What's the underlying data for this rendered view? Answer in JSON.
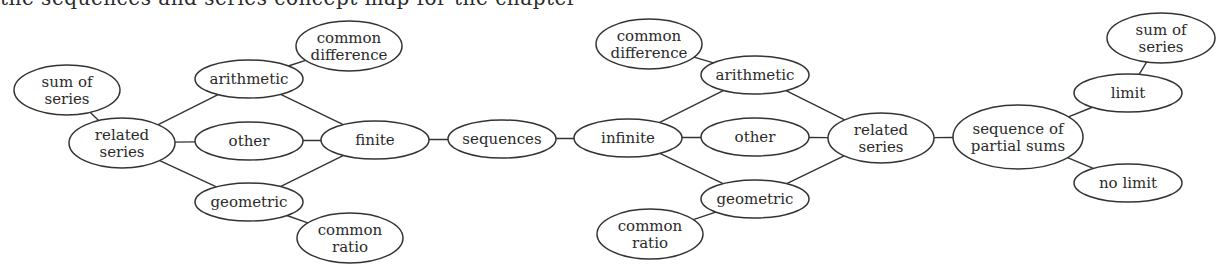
{
  "clipped_header_text": "the sequences and series concept map for the chapter",
  "diagram": {
    "type": "concept-map",
    "nodes": [
      {
        "id": "sum_series_l",
        "lines": [
          "sum of",
          "series"
        ],
        "cx": 67,
        "cy": 90,
        "rx": 53,
        "ry": 25
      },
      {
        "id": "related_l",
        "lines": [
          "related",
          "series"
        ],
        "cx": 122,
        "cy": 143,
        "rx": 53,
        "ry": 25
      },
      {
        "id": "arith_l",
        "lines": [
          "arithmetic"
        ],
        "cx": 249,
        "cy": 79,
        "rx": 54,
        "ry": 19
      },
      {
        "id": "cdiff_l",
        "lines": [
          "common",
          "difference"
        ],
        "cx": 349,
        "cy": 46,
        "rx": 53,
        "ry": 25
      },
      {
        "id": "other_l",
        "lines": [
          "other"
        ],
        "cx": 249,
        "cy": 141,
        "rx": 54,
        "ry": 19
      },
      {
        "id": "finite",
        "lines": [
          "finite"
        ],
        "cx": 375,
        "cy": 140,
        "rx": 54,
        "ry": 19
      },
      {
        "id": "geom_l",
        "lines": [
          "geometric"
        ],
        "cx": 249,
        "cy": 202,
        "rx": 54,
        "ry": 19
      },
      {
        "id": "cratio_l",
        "lines": [
          "common",
          "ratio"
        ],
        "cx": 350,
        "cy": 238,
        "rx": 53,
        "ry": 25
      },
      {
        "id": "sequences",
        "lines": [
          "sequences"
        ],
        "cx": 502,
        "cy": 139,
        "rx": 54,
        "ry": 19
      },
      {
        "id": "infinite",
        "lines": [
          "infinite"
        ],
        "cx": 628,
        "cy": 138,
        "rx": 54,
        "ry": 19
      },
      {
        "id": "cdiff_r",
        "lines": [
          "common",
          "difference"
        ],
        "cx": 649,
        "cy": 44,
        "rx": 53,
        "ry": 25
      },
      {
        "id": "arith_r",
        "lines": [
          "arithmetic"
        ],
        "cx": 755,
        "cy": 75,
        "rx": 54,
        "ry": 19
      },
      {
        "id": "other_r",
        "lines": [
          "other"
        ],
        "cx": 755,
        "cy": 137,
        "rx": 54,
        "ry": 19
      },
      {
        "id": "geom_r",
        "lines": [
          "geometric"
        ],
        "cx": 755,
        "cy": 199,
        "rx": 54,
        "ry": 19
      },
      {
        "id": "cratio_r",
        "lines": [
          "common",
          "ratio"
        ],
        "cx": 650,
        "cy": 234,
        "rx": 53,
        "ry": 25
      },
      {
        "id": "related_r",
        "lines": [
          "related",
          "series"
        ],
        "cx": 881,
        "cy": 138,
        "rx": 53,
        "ry": 25
      },
      {
        "id": "partial_sums",
        "lines": [
          "sequence of",
          "partial sums"
        ],
        "cx": 1018,
        "cy": 137,
        "rx": 65,
        "ry": 32
      },
      {
        "id": "limit",
        "lines": [
          "limit"
        ],
        "cx": 1128,
        "cy": 93,
        "rx": 54,
        "ry": 19
      },
      {
        "id": "sum_series_r",
        "lines": [
          "sum of",
          "series"
        ],
        "cx": 1161,
        "cy": 38,
        "rx": 54,
        "ry": 25
      },
      {
        "id": "no_limit",
        "lines": [
          "no limit"
        ],
        "cx": 1128,
        "cy": 183,
        "rx": 54,
        "ry": 19
      }
    ],
    "edges": [
      [
        "sum_series_l",
        "related_l"
      ],
      [
        "related_l",
        "arith_l"
      ],
      [
        "related_l",
        "other_l"
      ],
      [
        "related_l",
        "geom_l"
      ],
      [
        "arith_l",
        "cdiff_l"
      ],
      [
        "arith_l",
        "finite"
      ],
      [
        "other_l",
        "finite"
      ],
      [
        "geom_l",
        "finite"
      ],
      [
        "geom_l",
        "cratio_l"
      ],
      [
        "finite",
        "sequences"
      ],
      [
        "sequences",
        "infinite"
      ],
      [
        "infinite",
        "arith_r"
      ],
      [
        "infinite",
        "other_r"
      ],
      [
        "infinite",
        "geom_r"
      ],
      [
        "arith_r",
        "cdiff_r"
      ],
      [
        "geom_r",
        "cratio_r"
      ],
      [
        "arith_r",
        "related_r"
      ],
      [
        "other_r",
        "related_r"
      ],
      [
        "geom_r",
        "related_r"
      ],
      [
        "related_r",
        "partial_sums"
      ],
      [
        "partial_sums",
        "limit"
      ],
      [
        "partial_sums",
        "no_limit"
      ],
      [
        "limit",
        "sum_series_r"
      ]
    ]
  }
}
